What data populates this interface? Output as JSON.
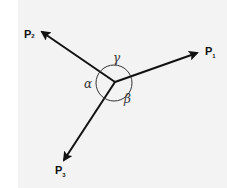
{
  "diagram": {
    "type": "vector-forces",
    "vectors": [
      {
        "label": "P",
        "subscript": "1"
      },
      {
        "label": "P",
        "subscript": "2"
      },
      {
        "label": "P",
        "subscript": "3"
      }
    ],
    "angles": {
      "alpha": "α",
      "beta": "β",
      "gamma": "γ"
    },
    "colors": {
      "line": "#111111",
      "background": "#f3f3f3"
    }
  }
}
